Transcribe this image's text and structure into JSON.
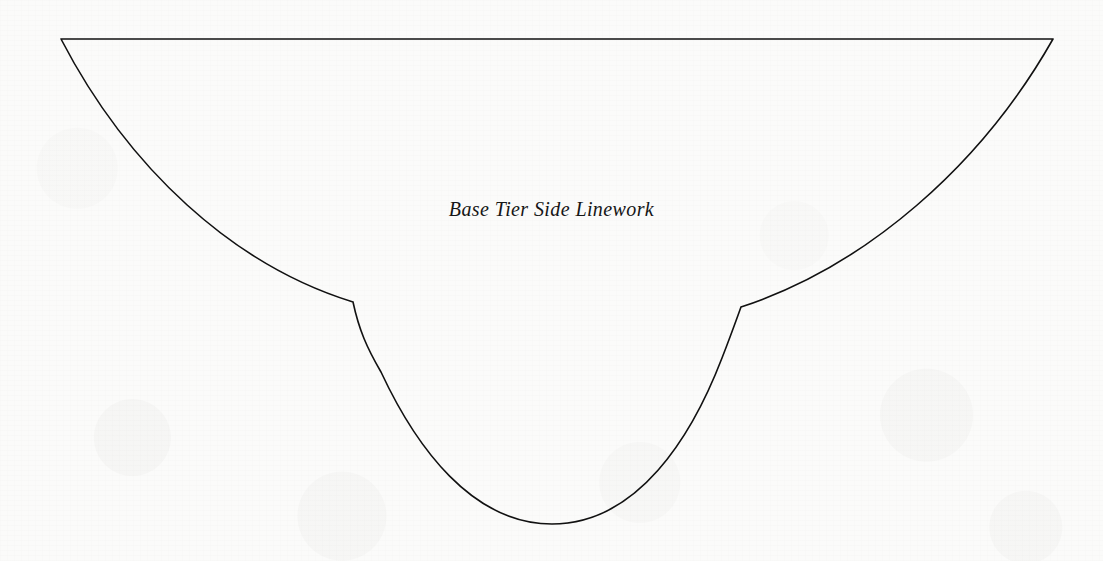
{
  "canvas": {
    "width": 1103,
    "height": 561,
    "background_color": "#fbfbfa",
    "ink_color": "#111111",
    "medium": "scanned-paper-line-drawing"
  },
  "label": {
    "text": "Base Tier Side Linework",
    "style": "italic-serif",
    "color": "#161616",
    "center_x": 555,
    "baseline_y": 218,
    "font_size_px": 20
  },
  "drawing": {
    "name": "base-tier-side-profile",
    "stroke_color": "#111111",
    "stroke_width_px": 1.6,
    "fill": "none",
    "segments": [
      {
        "name": "top-rim-line",
        "type": "line",
        "from": [
          61,
          39
        ],
        "to": [
          1053,
          39
        ]
      },
      {
        "name": "left-outer-flare-curve",
        "type": "cubic-bezier",
        "from": [
          61,
          39
        ],
        "control1": [
          128,
          168
        ],
        "control2": [
          233,
          265
        ],
        "to": [
          353,
          302
        ]
      },
      {
        "name": "left-notch-step",
        "type": "cubic-bezier",
        "from": [
          353,
          302
        ],
        "control1": [
          359,
          330
        ],
        "control2": [
          367,
          348
        ],
        "to": [
          381,
          372
        ]
      },
      {
        "name": "bowl-left-sweep",
        "type": "cubic-bezier",
        "from": [
          381,
          372
        ],
        "control1": [
          416,
          447
        ],
        "control2": [
          472,
          524
        ],
        "to": [
          552,
          524
        ]
      },
      {
        "name": "bowl-right-sweep",
        "type": "cubic-bezier",
        "from": [
          552,
          524
        ],
        "control1": [
          638,
          524
        ],
        "control2": [
          692,
          436
        ],
        "to": [
          722,
          358
        ]
      },
      {
        "name": "right-notch-step",
        "type": "cubic-bezier",
        "from": [
          722,
          358
        ],
        "control1": [
          731,
          335
        ],
        "control2": [
          737,
          318
        ],
        "to": [
          741,
          307
        ]
      },
      {
        "name": "right-outer-flare-curve",
        "type": "cubic-bezier",
        "from": [
          741,
          307
        ],
        "control1": [
          866,
          266
        ],
        "control2": [
          981,
          166
        ],
        "to": [
          1053,
          39
        ]
      }
    ],
    "vertices": [
      {
        "name": "top-left-corner",
        "x": 61,
        "y": 39
      },
      {
        "name": "top-right-corner",
        "x": 1053,
        "y": 39
      },
      {
        "name": "left-notch-vertex",
        "x": 353,
        "y": 302
      },
      {
        "name": "right-notch-vertex",
        "x": 741,
        "y": 307
      },
      {
        "name": "bowl-lowest-point",
        "x": 552,
        "y": 524
      }
    ]
  }
}
